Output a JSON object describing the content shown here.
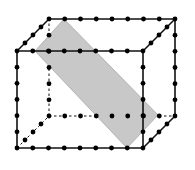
{
  "diagram": {
    "type": "cuboid-lattice-with-plane-section",
    "grid": {
      "width_segments": 8,
      "height_segments": 6,
      "depth_segments": 4
    },
    "colors": {
      "edge": "#111111",
      "dot": "#000000",
      "plane_fill": "#c8c8c8",
      "plane_stroke": "#a8a8a8",
      "background": "#ffffff"
    },
    "front_face": {
      "x0": 17,
      "y0": 51,
      "x1": 143,
      "y1": 148
    },
    "depth_offset": {
      "dx": 32,
      "dy": -32
    },
    "plane": {
      "points": [
        [
          35,
          51
        ],
        [
          64,
          19
        ],
        [
          158,
          115
        ],
        [
          127,
          148
        ]
      ]
    }
  }
}
